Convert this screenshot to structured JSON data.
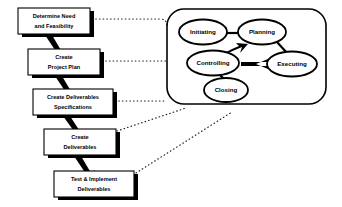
{
  "diagram": {
    "colors": {
      "background": "#ffffff",
      "stroke": "#000000",
      "shadow": "#000000",
      "fill": "#ffffff"
    },
    "process_flow": {
      "name": "project-deliverables-flow",
      "steps": [
        {
          "id": "step-1",
          "label_lines": [
            "Determine Need",
            "and Feasibility"
          ],
          "x": 18,
          "y": 8,
          "w": 72,
          "h": 26
        },
        {
          "id": "step-2",
          "label_lines": [
            "Create",
            "Project Plan"
          ],
          "x": 28,
          "y": 49,
          "w": 72,
          "h": 26
        },
        {
          "id": "step-3",
          "label_lines": [
            "Create Deliverables",
            "Specifications"
          ],
          "x": 33,
          "y": 89,
          "w": 80,
          "h": 26
        },
        {
          "id": "step-4",
          "label_lines": [
            "Create",
            "Deliverables"
          ],
          "x": 44,
          "y": 129,
          "w": 72,
          "h": 26
        },
        {
          "id": "step-5",
          "label_lines": [
            "Test & Implement",
            "Deliverables"
          ],
          "x": 54,
          "y": 171,
          "w": 80,
          "h": 26
        }
      ],
      "arrows": [
        {
          "id": "arrow-1-2",
          "from": "step-1",
          "to": "step-2"
        },
        {
          "id": "arrow-2-3",
          "from": "step-2",
          "to": "step-3"
        },
        {
          "id": "arrow-3-4",
          "from": "step-3",
          "to": "step-4"
        },
        {
          "id": "arrow-4-5",
          "from": "step-4",
          "to": "step-5"
        }
      ]
    },
    "process_groups": {
      "name": "project-management-process-groups",
      "container": {
        "x": 167,
        "y": 9,
        "w": 159,
        "h": 95,
        "r": 17
      },
      "ovals": [
        {
          "id": "oval-initiating",
          "label": "Initiating",
          "cx": 203,
          "cy": 32,
          "rx": 24,
          "ry": 12.5
        },
        {
          "id": "oval-planning",
          "label": "Planning",
          "cx": 262,
          "cy": 32,
          "rx": 24,
          "ry": 12.5
        },
        {
          "id": "oval-controlling",
          "label": "Controlling",
          "cx": 213,
          "cy": 63,
          "rx": 26,
          "ry": 12.5
        },
        {
          "id": "oval-executing",
          "label": "Executing",
          "cx": 292,
          "cy": 64,
          "rx": 25,
          "ry": 12.5
        },
        {
          "id": "oval-closing",
          "label": "Closing",
          "cx": 226,
          "cy": 90,
          "rx": 22,
          "ry": 12
        }
      ],
      "connectors": [
        {
          "id": "link-initiating-planning",
          "from": "Initiating",
          "to": "Planning",
          "style": "solid-line"
        },
        {
          "id": "link-planning-executing",
          "from": "Planning",
          "to": "Executing",
          "style": "solid-line"
        },
        {
          "id": "link-executing-controlling",
          "from": "Executing",
          "to": "Controlling",
          "style": "solid-arrow"
        },
        {
          "id": "link-controlling-planning",
          "from": "Controlling",
          "to": "Planning",
          "style": "solid-arrow"
        },
        {
          "id": "link-controlling-closing",
          "from": "Controlling",
          "to": "Closing",
          "style": "solid-line"
        }
      ]
    },
    "dotted_links": [
      {
        "id": "dotted-step1-container",
        "from": "step-1",
        "to": "process-groups"
      },
      {
        "id": "dotted-step2-container",
        "from": "step-2",
        "to": "process-groups"
      },
      {
        "id": "dotted-step3-container",
        "from": "step-3",
        "to": "process-groups"
      },
      {
        "id": "dotted-step4-container",
        "from": "step-4",
        "to": "process-groups"
      },
      {
        "id": "dotted-step5-container",
        "from": "step-5",
        "to": "process-groups"
      }
    ]
  }
}
